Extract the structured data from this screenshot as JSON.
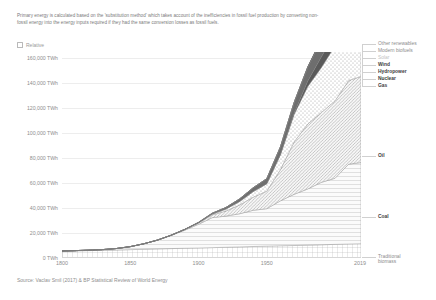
{
  "subtitle": "Primary energy is calculated based on the 'substitution method' which takes account of the inefficiencies in fossil fuel production by converting non-fossil energy into the energy inputs required if they had the same conversion losses as fossil fuels.",
  "controls": {
    "relative_label": "Relative",
    "relative_checked": false
  },
  "source": "Source: Vaclav Smil (2017) & BP Statistical Review of World Energy",
  "chart_data": {
    "type": "area",
    "title": "",
    "xlabel": "",
    "ylabel": "",
    "stacked": true,
    "grid": true,
    "legend_position": "right",
    "xlim": [
      1800,
      2019
    ],
    "ylim": [
      0,
      165000
    ],
    "ytick_labels": [
      "0 TWh",
      "20,000 TWh",
      "40,000 TWh",
      "60,000 TWh",
      "80,000 TWh",
      "100,000 TWh",
      "120,000 TWh",
      "140,000 TWh",
      "160,000 TWh"
    ],
    "ytick_values": [
      0,
      20000,
      40000,
      60000,
      80000,
      100000,
      120000,
      140000,
      160000
    ],
    "xtick_labels": [
      "1800",
      "1850",
      "1900",
      "1950",
      "2019"
    ],
    "xtick_values": [
      1800,
      1850,
      1900,
      1950,
      2019
    ],
    "x": [
      1800,
      1810,
      1820,
      1830,
      1840,
      1850,
      1860,
      1870,
      1880,
      1890,
      1900,
      1910,
      1920,
      1930,
      1940,
      1950,
      1960,
      1970,
      1980,
      1990,
      2000,
      2010,
      2019
    ],
    "series": [
      {
        "name": "Traditional biomass",
        "pattern": "grid",
        "color": "#ffffff",
        "values": [
          5560,
          5750,
          5950,
          6150,
          6400,
          6700,
          7000,
          7300,
          7550,
          7800,
          8000,
          8300,
          8600,
          8900,
          9200,
          9500,
          9800,
          10000,
          10300,
          10600,
          10900,
          11200,
          11400
        ]
      },
      {
        "name": "Coal",
        "pattern": "horizontal-lines",
        "color": "#f2f2f2",
        "values": [
          100,
          180,
          350,
          600,
          1200,
          2400,
          4400,
          7000,
          10500,
          14500,
          19000,
          24000,
          25000,
          26500,
          29000,
          30000,
          36000,
          41000,
          45000,
          50000,
          53000,
          64000,
          65000
        ]
      },
      {
        "name": "Oil",
        "pattern": "diagonal-hatch",
        "color": "#e6e6e6",
        "values": [
          0,
          0,
          0,
          0,
          0,
          0,
          10,
          60,
          200,
          500,
          1000,
          2200,
          4000,
          7000,
          10500,
          14000,
          25000,
          42000,
          52000,
          56000,
          62000,
          67000,
          69000
        ]
      },
      {
        "name": "Gas",
        "pattern": "dots",
        "color": "#fafafa",
        "values": [
          0,
          0,
          0,
          0,
          0,
          0,
          0,
          10,
          40,
          120,
          300,
          700,
          1600,
          2800,
          4500,
          6000,
          12000,
          22000,
          30000,
          36000,
          44000,
          52000,
          56000
        ]
      },
      {
        "name": "Nuclear",
        "pattern": "solid",
        "color": "#5a5a5a",
        "values": [
          0,
          0,
          0,
          0,
          0,
          0,
          0,
          0,
          0,
          0,
          0,
          0,
          0,
          0,
          0,
          0,
          200,
          1000,
          4500,
          8500,
          10500,
          10500,
          10000
        ]
      },
      {
        "name": "Hydropower",
        "pattern": "solid",
        "color": "#6e6e6e",
        "values": [
          0,
          0,
          0,
          0,
          0,
          0,
          0,
          0,
          0,
          50,
          200,
          600,
          1200,
          2000,
          3000,
          4000,
          6000,
          8500,
          11000,
          13500,
          15500,
          18000,
          20000
        ]
      },
      {
        "name": "Wind",
        "pattern": "solid",
        "color": "#808080",
        "values": [
          0,
          0,
          0,
          0,
          0,
          0,
          0,
          0,
          0,
          0,
          0,
          0,
          0,
          0,
          0,
          0,
          0,
          0,
          0,
          100,
          700,
          3500,
          9000
        ]
      },
      {
        "name": "Solar",
        "pattern": "solid",
        "color": "#cfcfcf",
        "values": [
          0,
          0,
          0,
          0,
          0,
          0,
          0,
          0,
          0,
          0,
          0,
          0,
          0,
          0,
          0,
          0,
          0,
          0,
          0,
          10,
          100,
          700,
          5500
        ]
      },
      {
        "name": "Modern biofuels",
        "pattern": "solid",
        "color": "#9a9a9a",
        "values": [
          0,
          0,
          0,
          0,
          0,
          0,
          0,
          0,
          0,
          0,
          0,
          0,
          0,
          0,
          0,
          0,
          0,
          0,
          100,
          400,
          1200,
          2800,
          3800
        ]
      },
      {
        "name": "Other renewables",
        "pattern": "solid",
        "color": "#4a4a4a",
        "values": [
          0,
          0,
          0,
          0,
          0,
          0,
          0,
          0,
          0,
          0,
          0,
          0,
          0,
          0,
          0,
          0,
          0,
          100,
          400,
          800,
          1500,
          2800,
          4500
        ]
      }
    ],
    "legend_entries": [
      {
        "label": "Other renewables",
        "tone": "mid"
      },
      {
        "label": "Modern biofuels",
        "tone": "mid"
      },
      {
        "label": "Solar",
        "tone": "light"
      },
      {
        "label": "Wind",
        "tone": "dark"
      },
      {
        "label": "Hydropower",
        "tone": "dark"
      },
      {
        "label": "Nuclear",
        "tone": "dark"
      },
      {
        "label": "Gas",
        "tone": "dark"
      },
      {
        "label": "Oil",
        "tone": "dark"
      },
      {
        "label": "Coal",
        "tone": "dark"
      },
      {
        "label": "Traditional biomass",
        "tone": "mid"
      }
    ]
  }
}
